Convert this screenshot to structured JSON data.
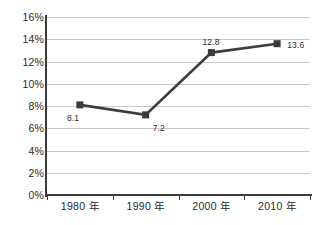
{
  "chart_data": {
    "type": "line",
    "title": "",
    "subtitle": "",
    "xlabel": "",
    "ylabel": "",
    "categories": [
      "1980 年",
      "1990 年",
      "2000 年",
      "2010 年"
    ],
    "values": [
      8.1,
      7.2,
      12.8,
      13.6
    ],
    "point_labels": [
      "8.1",
      "7.2",
      "12.8",
      "13.6"
    ],
    "series": [
      {
        "name": "",
        "values": [
          8.1,
          7.2,
          12.8,
          13.6
        ]
      }
    ],
    "ylim": [
      0,
      16
    ],
    "ytick_step": 2,
    "ytick_labels": [
      "16%",
      "14%",
      "12%",
      "10%",
      "8%",
      "6%",
      "4%",
      "2%",
      "0%"
    ],
    "ytick_values": [
      16,
      14,
      12,
      10,
      8,
      6,
      4,
      2,
      0
    ],
    "xtick_labels": [
      "1980 年",
      "1990 年",
      "2000 年",
      "2010 年"
    ],
    "grid": "horizontal",
    "legend": "none",
    "marker": "square",
    "annotations": []
  },
  "style": {
    "series_color": "#3d3d3d",
    "marker_color": "#3a3a3a",
    "grid_color": "#c9c9c9",
    "axis_color": "#3c3c3c",
    "text_color": "#2b2b2b",
    "background": "#ffffff"
  }
}
